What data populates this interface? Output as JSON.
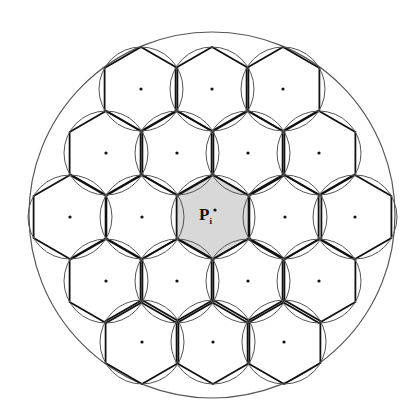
{
  "diagram": {
    "type": "hexagonal-cell-layout",
    "outer_circle": {
      "cx": 212,
      "cy": 215,
      "r": 183,
      "stroke": "#555555"
    },
    "hex_radius": 42,
    "colors": {
      "hex_stroke": "#111111",
      "circle_stroke": "#555555",
      "center_fill": "#d8d8d8",
      "dot": "#111111"
    },
    "cells": [
      {
        "x": 141,
        "y": 89
      },
      {
        "x": 212,
        "y": 89
      },
      {
        "x": 283,
        "y": 89
      },
      {
        "x": 106,
        "y": 153
      },
      {
        "x": 177,
        "y": 153
      },
      {
        "x": 248,
        "y": 153
      },
      {
        "x": 319,
        "y": 153
      },
      {
        "x": 70,
        "y": 217
      },
      {
        "x": 142,
        "y": 217
      },
      {
        "x": 213,
        "y": 217,
        "center": true
      },
      {
        "x": 285,
        "y": 217
      },
      {
        "x": 355,
        "y": 217
      },
      {
        "x": 106,
        "y": 281
      },
      {
        "x": 177,
        "y": 281
      },
      {
        "x": 248,
        "y": 281
      },
      {
        "x": 319,
        "y": 281
      },
      {
        "x": 142,
        "y": 342
      },
      {
        "x": 213,
        "y": 342
      },
      {
        "x": 284,
        "y": 342
      }
    ],
    "center_label": {
      "main": "P",
      "sub": "i"
    }
  }
}
